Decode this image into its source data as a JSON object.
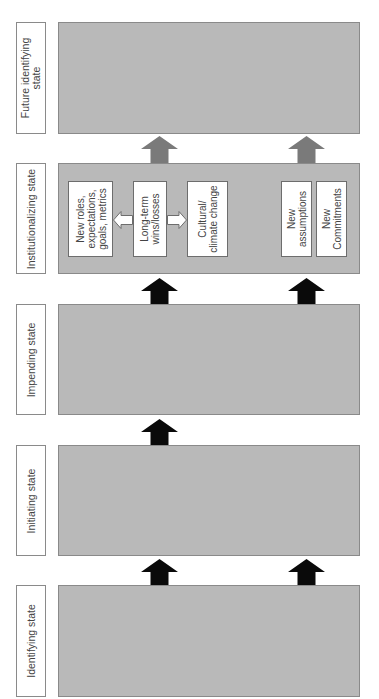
{
  "diagram": {
    "states": [
      {
        "id": "future-identifying",
        "label": "Future identifying\nstate",
        "label_lines": [
          "Future identifying",
          "state"
        ]
      },
      {
        "id": "institutionalizing",
        "label": "Institutionalizing state",
        "label_lines": [
          "Institutionalizing state"
        ]
      },
      {
        "id": "impending",
        "label": "Impending state",
        "label_lines": [
          "Impending state"
        ]
      },
      {
        "id": "initiating",
        "label": "Initiating state",
        "label_lines": [
          "Initiating state"
        ]
      },
      {
        "id": "identifying",
        "label": "Identifying state",
        "label_lines": [
          "Identifying state"
        ]
      }
    ],
    "institutionalizing_items": [
      {
        "id": "new-roles",
        "lines": [
          "New roles,",
          "expectations,",
          "goals, metrics"
        ]
      },
      {
        "id": "long-term",
        "lines": [
          "Long-term",
          "wins/losses"
        ]
      },
      {
        "id": "cultural",
        "lines": [
          "Cultural/",
          "climate change"
        ]
      },
      {
        "id": "new-assumptions",
        "lines": [
          "New",
          "assumptions"
        ]
      },
      {
        "id": "new-commitments",
        "lines": [
          "New",
          "Commitments"
        ]
      }
    ],
    "connections": [
      {
        "from": "identifying",
        "to": "initiating",
        "arrows": [
          "left",
          "right"
        ],
        "color": "black"
      },
      {
        "from": "initiating",
        "to": "impending",
        "arrows": [
          "left"
        ],
        "color": "black"
      },
      {
        "from": "impending",
        "to": "institutionalizing",
        "arrows": [
          "left",
          "right"
        ],
        "color": "black"
      },
      {
        "from": "institutionalizing",
        "to": "future-identifying",
        "arrows": [
          "left",
          "right"
        ],
        "color": "gray"
      }
    ],
    "internal_arrows": [
      {
        "from": "long-term",
        "to": "new-roles",
        "style": "white-outline"
      },
      {
        "from": "long-term",
        "to": "cultural",
        "style": "white-outline"
      }
    ],
    "colors": {
      "state_fill": "#b9b9b9",
      "border": "#8a8a8a",
      "black_arrow": "#0a0a0a",
      "gray_arrow": "#7a7a7a"
    }
  }
}
